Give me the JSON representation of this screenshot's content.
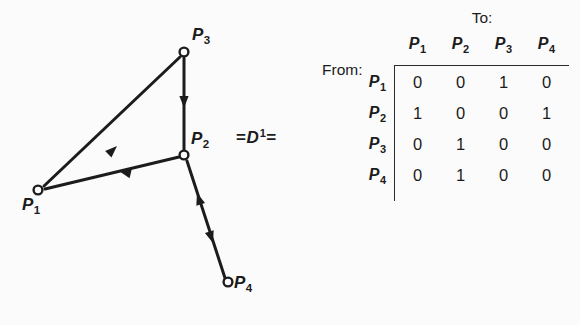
{
  "figure": {
    "graph": {
      "nodes": [
        {
          "id": "P1",
          "label": "P",
          "subscript": "1",
          "x": 38,
          "y": 190,
          "label_x": 22,
          "label_y": 196
        },
        {
          "id": "P2",
          "label": "P",
          "subscript": "2",
          "x": 184,
          "y": 155,
          "label_x": 191,
          "label_y": 130
        },
        {
          "id": "P3",
          "label": "P",
          "subscript": "3",
          "x": 184,
          "y": 52,
          "label_x": 192,
          "label_y": 26
        },
        {
          "id": "P4",
          "label": "P",
          "subscript": "4",
          "x": 228,
          "y": 282,
          "label_x": 234,
          "label_y": 274
        }
      ],
      "edges": [
        {
          "from": "P1",
          "to": "P3",
          "direction": "P1-to-P3"
        },
        {
          "from": "P3",
          "to": "P2",
          "direction": "P3-to-P2"
        },
        {
          "from": "P2",
          "to": "P1",
          "direction": "P2-to-P1"
        },
        {
          "from": "P2",
          "to": "P4",
          "direction": "bidirectional"
        }
      ],
      "node_marker": "open-circle",
      "line_color": "#1c1c1c"
    },
    "equals_expression": {
      "left_equals": "=",
      "symbol": "D",
      "exponent": "1",
      "right_equals": "="
    },
    "matrix": {
      "to_caption": "To:",
      "from_caption": "From:",
      "column_headers": [
        {
          "label": "P",
          "subscript": "1"
        },
        {
          "label": "P",
          "subscript": "2"
        },
        {
          "label": "P",
          "subscript": "3"
        },
        {
          "label": "P",
          "subscript": "4"
        }
      ],
      "row_headers": [
        {
          "label": "P",
          "subscript": "1"
        },
        {
          "label": "P",
          "subscript": "2"
        },
        {
          "label": "P",
          "subscript": "3"
        },
        {
          "label": "P",
          "subscript": "4"
        }
      ],
      "rows": [
        [
          "0",
          "0",
          "1",
          "0"
        ],
        [
          "1",
          "0",
          "0",
          "1"
        ],
        [
          "0",
          "1",
          "0",
          "0"
        ],
        [
          "0",
          "1",
          "0",
          "0"
        ]
      ]
    }
  },
  "colors": {
    "background": "#fbfbfb",
    "ink": "#1c1c1c",
    "rule": "#2a2a2a"
  }
}
